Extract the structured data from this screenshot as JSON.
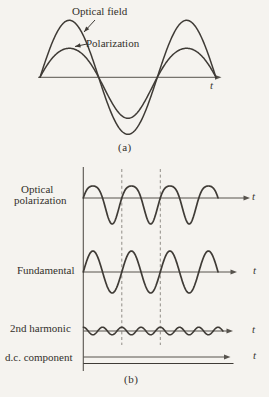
{
  "figure": {
    "panel_a": {
      "caption": "(a)",
      "label_optical_field": "Optical field",
      "label_polarization": "Polarization",
      "axis_label": "t"
    },
    "panel_b": {
      "caption": "(b)",
      "rows": [
        {
          "label_line1": "Optical",
          "label_line2": "polarization",
          "axis_label": "t"
        },
        {
          "label": "Fundamental",
          "axis_label": "t"
        },
        {
          "label": "2nd harmonic",
          "axis_label": "t"
        },
        {
          "label": "d.c. component",
          "axis_label": "t"
        }
      ]
    }
  },
  "colors": {
    "background": "#f5f3ef",
    "ink": "#3f3b36",
    "axis": "#57534d",
    "dash": "#908c86",
    "text": "#33302b"
  },
  "chart_data": {
    "type": "line",
    "panels": [
      {
        "id": "a",
        "caption": "(a)",
        "xlabel": "t",
        "axes": {
          "h": {
            "x0": 38,
            "arrow_x": 221.5,
            "y": 77.3
          }
        },
        "series": [
          {
            "name": "Optical field",
            "x0": 40,
            "x1": 216,
            "baseline_y": 77.3,
            "period_px": 117.3,
            "amp_sin": 57,
            "amp_distort": 0,
            "amp_cos2": 0,
            "width": 1.5
          },
          {
            "name": "Polarization",
            "x0": 40,
            "x1": 216,
            "baseline_y": 77.3,
            "period_px": 117.3,
            "amp_sin": 35,
            "amp_distort": 3,
            "amp_cos2": 0,
            "width": 1.5
          }
        ],
        "annotation_arrows": [
          {
            "from": [
              95,
              20
            ],
            "to": [
              84,
              32
            ]
          },
          {
            "from": [
              87,
              44
            ],
            "to": [
              75,
              46.5
            ]
          }
        ]
      },
      {
        "id": "b",
        "caption": "(b)",
        "xlabel": "t",
        "axes": {
          "v": {
            "x": 83.3,
            "y0": 167,
            "y1": 371
          }
        },
        "rows": [
          {
            "name": "Optical polarization",
            "axis_y": 198,
            "arrow_x": 250,
            "wave": {
              "x0": 83.3,
              "x1": 218,
              "period_px": 38.5,
              "amp_sin": 19,
              "amp_distort": 3.5,
              "amp_cos2": 0,
              "width": 1.7
            }
          },
          {
            "name": "Fundamental",
            "axis_y": 272,
            "arrow_x": 237,
            "wave": {
              "x0": 83.3,
              "x1": 218,
              "period_px": 38.5,
              "amp_sin": 21,
              "amp_distort": 0,
              "amp_cos2": 0,
              "width": 1.7
            }
          },
          {
            "name": "2nd harmonic",
            "axis_y": 331,
            "arrow_x": 233,
            "wave": {
              "x0": 83.3,
              "x1": 222.9,
              "period_px": 38.5,
              "amp_sin": 0,
              "amp_distort": 0,
              "amp_cos2": 3.8,
              "width": 1.6
            }
          },
          {
            "name": "d.c. component",
            "axis_y": 357,
            "arrow_x": 230.5,
            "dc_line": {
              "y": 363.5,
              "x1": 233.5
            }
          }
        ],
        "dashed_lines": {
          "x": [
            121.8,
            160.3
          ],
          "y0": 169,
          "y1": 345
        }
      }
    ]
  }
}
